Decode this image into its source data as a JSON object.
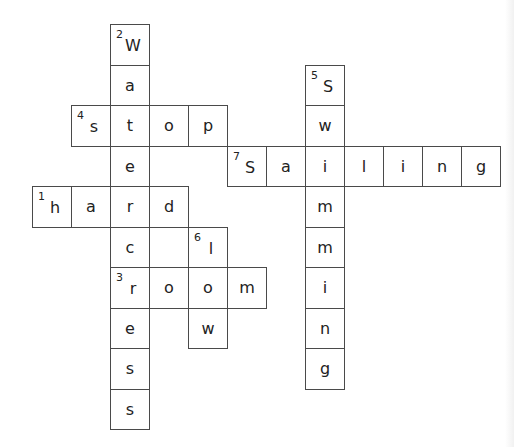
{
  "puzzle": {
    "type": "crossword",
    "grid": {
      "origin_x": 32,
      "origin_y": 24,
      "col_width": 39,
      "row_height": 40.5
    },
    "words": [
      {
        "number": 1,
        "direction": "across",
        "answer": "hard",
        "row": 4,
        "col": 0
      },
      {
        "number": 2,
        "direction": "down",
        "answer": "watercress",
        "row": 0,
        "col": 2
      },
      {
        "number": 3,
        "direction": "across",
        "answer": "room",
        "row": 6,
        "col": 2
      },
      {
        "number": 4,
        "direction": "across",
        "answer": "stop",
        "row": 2,
        "col": 1
      },
      {
        "number": 5,
        "direction": "down",
        "answer": "swimming",
        "row": 1,
        "col": 7
      },
      {
        "number": 6,
        "direction": "down",
        "answer": "low",
        "row": 5,
        "col": 4
      },
      {
        "number": 7,
        "direction": "across",
        "answer": "sailing",
        "row": 3,
        "col": 5
      }
    ],
    "cells": [
      {
        "row": 0,
        "col": 2,
        "letter": "W",
        "number": "2"
      },
      {
        "row": 1,
        "col": 2,
        "letter": "a"
      },
      {
        "row": 2,
        "col": 1,
        "letter": "s",
        "number": "4"
      },
      {
        "row": 2,
        "col": 2,
        "letter": "t"
      },
      {
        "row": 2,
        "col": 3,
        "letter": "o"
      },
      {
        "row": 2,
        "col": 4,
        "letter": "p"
      },
      {
        "row": 3,
        "col": 2,
        "letter": "e"
      },
      {
        "row": 4,
        "col": 0,
        "letter": "h",
        "number": "1"
      },
      {
        "row": 4,
        "col": 1,
        "letter": "a"
      },
      {
        "row": 4,
        "col": 2,
        "letter": "r"
      },
      {
        "row": 4,
        "col": 3,
        "letter": "d"
      },
      {
        "row": 5,
        "col": 2,
        "letter": "c"
      },
      {
        "row": 6,
        "col": 2,
        "letter": "r",
        "number": "3"
      },
      {
        "row": 6,
        "col": 3,
        "letter": "o"
      },
      {
        "row": 6,
        "col": 4,
        "letter": "o"
      },
      {
        "row": 6,
        "col": 5,
        "letter": "m"
      },
      {
        "row": 7,
        "col": 2,
        "letter": "e"
      },
      {
        "row": 8,
        "col": 2,
        "letter": "s"
      },
      {
        "row": 9,
        "col": 2,
        "letter": "s"
      },
      {
        "row": 5,
        "col": 4,
        "letter": "l",
        "number": "6"
      },
      {
        "row": 7,
        "col": 4,
        "letter": "w"
      },
      {
        "row": 1,
        "col": 7,
        "letter": "S",
        "number": "5"
      },
      {
        "row": 2,
        "col": 7,
        "letter": "w"
      },
      {
        "row": 3,
        "col": 7,
        "letter": "i"
      },
      {
        "row": 4,
        "col": 7,
        "letter": "m"
      },
      {
        "row": 5,
        "col": 7,
        "letter": "m"
      },
      {
        "row": 6,
        "col": 7,
        "letter": "i"
      },
      {
        "row": 7,
        "col": 7,
        "letter": "n"
      },
      {
        "row": 8,
        "col": 7,
        "letter": "g"
      },
      {
        "row": 3,
        "col": 5,
        "letter": "S",
        "number": "7"
      },
      {
        "row": 3,
        "col": 6,
        "letter": "a"
      },
      {
        "row": 3,
        "col": 8,
        "letter": "l"
      },
      {
        "row": 3,
        "col": 9,
        "letter": "i"
      },
      {
        "row": 3,
        "col": 10,
        "letter": "n"
      },
      {
        "row": 3,
        "col": 11,
        "letter": "g"
      }
    ]
  }
}
